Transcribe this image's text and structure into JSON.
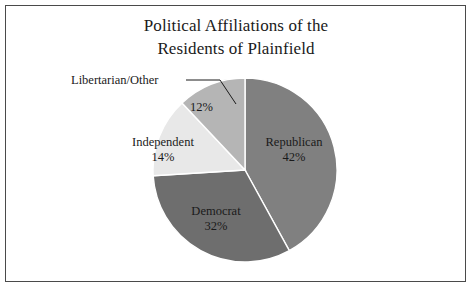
{
  "chart_data": {
    "type": "pie",
    "title": "Political Affiliations of the Residents of Plainfield",
    "title_lines": [
      "Political Affiliations of the",
      "Residents of Plainfield"
    ],
    "categories": [
      "Republican",
      "Democrat",
      "Independent",
      "Libertarian/Other"
    ],
    "values": [
      42,
      32,
      14,
      12
    ],
    "value_labels": [
      "42%",
      "32%",
      "14%",
      "12%"
    ],
    "units": "percent",
    "total": 100,
    "start_angle_deg": 0,
    "direction": "clockwise",
    "legend": "none",
    "grid": false,
    "slice_colors": [
      "#808080",
      "#6e6e6e",
      "#e8e8e8",
      "#b5b5b5"
    ],
    "slice_edge_color": "#ffffff",
    "slices": [
      {
        "name": "Republican",
        "value": 42,
        "label": "42%",
        "color": "#808080",
        "label_position": "inside"
      },
      {
        "name": "Democrat",
        "value": 32,
        "label": "32%",
        "color": "#6e6e6e",
        "label_position": "inside"
      },
      {
        "name": "Independent",
        "value": 14,
        "label": "14%",
        "color": "#e8e8e8",
        "label_position": "outside-left"
      },
      {
        "name": "Libertarian/Other",
        "value": 12,
        "label": "12%",
        "color": "#b5b5b5",
        "label_position": "outside-leader"
      }
    ]
  },
  "labels": {
    "republican_name": "Republican",
    "republican_pct": "42%",
    "democrat_name": "Democrat",
    "democrat_pct": "32%",
    "independent_name": "Independent",
    "independent_pct": "14%",
    "libertarian_name": "Libertarian/Other",
    "libertarian_pct": "12%"
  },
  "style": {
    "background": "#ffffff",
    "text_color": "#1a1a1a",
    "frame_color": "#4a4a4a"
  }
}
